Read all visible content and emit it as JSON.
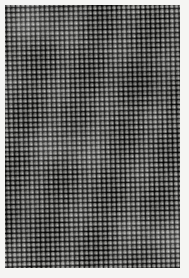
{
  "image": {
    "subject": "woven-fabric-macro",
    "description": "Extreme close-up macro photograph of a grayscale plain-weave textile, showing the regular over-under lattice of warp and weft yarns with dark open interstices between the threads.",
    "medium": "photograph",
    "color_mode": "grayscale",
    "orientation": "portrait",
    "width_px": 189,
    "height_px": 278
  },
  "frame": {
    "background_color": "#f5f5f3",
    "margin_top_px": 5,
    "margin_left_px": 5,
    "margin_right_px": 9,
    "margin_bottom_px": 10
  },
  "fabric": {
    "weave_type": "plain weave (tabby)",
    "thread_pitch_px": 4.8,
    "warp_direction": "vertical",
    "weft_direction": "horizontal",
    "grid_rotation_deg": -1.4,
    "aspect": "approximately square cells",
    "threads_across": 37,
    "threads_down": 55,
    "surface_texture": "matte, slightly fuzzy yarns with visible open pinholes"
  },
  "tones": {
    "hole_shadow": "#2e2e2e",
    "yarn_midtone": "#8d8d8d",
    "yarn_highlight": "#dcdcd8",
    "overall_mean": "#8a8a87",
    "darkest": "#222222",
    "lightest": "#f2f2ee"
  },
  "features": {
    "moire_banding": "faint diagonal interference bands running lower-left to upper-right",
    "row_waviness": "slight undulation of weft rows across the width",
    "vignette": "mild darkening toward the outer edges",
    "focus": "sharp across the centre with gentle softening at the corners"
  }
}
